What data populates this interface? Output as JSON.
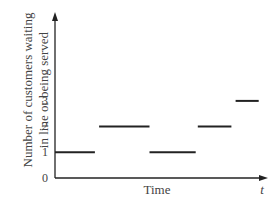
{
  "chart_data": {
    "type": "line",
    "subtype": "step",
    "title": "",
    "xlabel": "Time",
    "x_axis_symbol": "t",
    "ylabel": "Number of customers waiting in line or being served",
    "ylabel_lines": [
      "Number of customers waiting",
      "in line or being served"
    ],
    "yticks": [
      "0",
      "1",
      "2",
      "3"
    ],
    "ylim": [
      0,
      3
    ],
    "grid": false,
    "legend": null,
    "segments": [
      {
        "x_start": 0.0,
        "x_end": 0.19,
        "y": 1
      },
      {
        "x_start": 0.21,
        "x_end": 0.45,
        "y": 2
      },
      {
        "x_start": 0.45,
        "x_end": 0.67,
        "y": 1
      },
      {
        "x_start": 0.68,
        "x_end": 0.84,
        "y": 2
      },
      {
        "x_start": 0.86,
        "x_end": 0.97,
        "y": 3
      }
    ]
  },
  "colors": {
    "axis": "#222222",
    "line": "#222222",
    "text": "#444444"
  }
}
